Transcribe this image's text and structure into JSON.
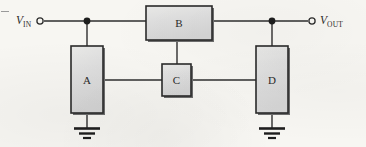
{
  "figure": {
    "kind": "circuit-block-diagram",
    "width": 366,
    "height": 147,
    "background_color": "#f7f6f2"
  },
  "style": {
    "wire_color": "#2e2e2e",
    "block_fill": "#dcdcdc",
    "block_fill_light": "#e8e8e6",
    "block_border": "#2a2a2a",
    "block_shadow": "#6d6d6d",
    "text_color": "#2a2a2a",
    "terminal_color": "#2e2e2e"
  },
  "terminals": [
    {
      "id": "vin",
      "label_v": "V",
      "label_sub": "IN",
      "x": 40,
      "y": 21
    },
    {
      "id": "vout",
      "label_v": "V",
      "label_sub": "OUT",
      "x": 312,
      "y": 21
    }
  ],
  "blocks": [
    {
      "id": "A",
      "label": "A",
      "x": 71,
      "y": 46,
      "w": 32,
      "h": 67,
      "orientation": "vertical"
    },
    {
      "id": "B",
      "label": "B",
      "x": 146,
      "y": 6,
      "w": 66,
      "h": 34,
      "orientation": "horizontal"
    },
    {
      "id": "C",
      "label": "C",
      "x": 162,
      "y": 64,
      "w": 29,
      "h": 32,
      "orientation": "square"
    },
    {
      "id": "D",
      "label": "D",
      "x": 256,
      "y": 46,
      "w": 32,
      "h": 67,
      "orientation": "vertical"
    }
  ],
  "junctions": [
    {
      "id": "node-in",
      "x": 87,
      "y": 21
    },
    {
      "id": "node-out",
      "x": 272,
      "y": 21
    }
  ],
  "grounds": [
    {
      "id": "ground-a",
      "x": 87,
      "y": 128,
      "bars": 3
    },
    {
      "id": "ground-d",
      "x": 272,
      "y": 128,
      "bars": 3
    }
  ],
  "wires": [
    {
      "id": "wire-vin-to-node",
      "from": "vin",
      "to": "node-in",
      "points": "44,21 87,21"
    },
    {
      "id": "wire-node-to-b",
      "from": "node-in",
      "to": "B",
      "points": "87,21 146,21"
    },
    {
      "id": "wire-b-to-node-out",
      "from": "B",
      "to": "node-out",
      "points": "212,21 272,21"
    },
    {
      "id": "wire-node-to-vout",
      "from": "node-out",
      "to": "vout",
      "points": "272,21 308,21"
    },
    {
      "id": "wire-node-to-a",
      "from": "node-in",
      "to": "A",
      "points": "87,21 87,46"
    },
    {
      "id": "wire-node-to-d",
      "from": "node-out",
      "to": "D",
      "points": "272,21 272,46"
    },
    {
      "id": "wire-b-to-c",
      "from": "B",
      "to": "C",
      "points": "177,40 177,64"
    },
    {
      "id": "wire-a-to-c",
      "from": "A",
      "to": "C",
      "points": "103,80 162,80"
    },
    {
      "id": "wire-c-to-d",
      "from": "C",
      "to": "D",
      "points": "191,80 256,80"
    },
    {
      "id": "wire-a-to-ground",
      "from": "A",
      "to": "ground-a",
      "points": "87,113 87,128"
    },
    {
      "id": "wire-d-to-ground",
      "from": "D",
      "to": "ground-d",
      "points": "272,113 272,128"
    }
  ]
}
